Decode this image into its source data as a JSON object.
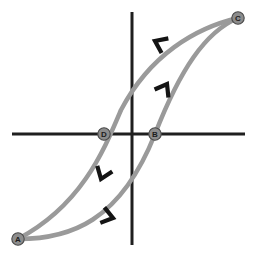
{
  "figure": {
    "title": "",
    "background_color": "#ffffff",
    "axis_color": "#1f1f1f",
    "curve_color": "#9a9a9a",
    "arrow_color": "#141414",
    "marker_fill": "#8c8c8c",
    "marker_stroke": "#4a4a4a",
    "label_color": "#1c1c1c"
  },
  "chart_data": {
    "type": "line",
    "title": "",
    "xlabel": "",
    "ylabel": "",
    "grid": false,
    "legend": null,
    "axes": {
      "origin": [
        132,
        134
      ],
      "x_axis": {
        "from": [
          12,
          134
        ],
        "to": [
          245,
          134
        ],
        "width": 3
      },
      "y_axis": {
        "from": [
          132,
          12
        ],
        "to": [
          132,
          245
        ],
        "width": 3
      }
    },
    "labeled_points": [
      {
        "label": "A",
        "x": 18,
        "y": 239,
        "role": "lower-left-saturation"
      },
      {
        "label": "B",
        "x": 155,
        "y": 134,
        "role": "positive-x-intercept"
      },
      {
        "label": "C",
        "x": 238,
        "y": 18,
        "role": "upper-right-saturation"
      },
      {
        "label": "D",
        "x": 104,
        "y": 134,
        "role": "negative-x-intercept"
      }
    ],
    "series": [
      {
        "name": "ascending-branch",
        "direction": "A to B to C",
        "path": "M 18 239 C 70 239, 120 222, 155 134 C 180 70, 205 32, 238 18",
        "points": [
          [
            18,
            239
          ],
          [
            60,
            236
          ],
          [
            100,
            222
          ],
          [
            135,
            186
          ],
          [
            155,
            134
          ],
          [
            175,
            84
          ],
          [
            205,
            44
          ],
          [
            238,
            18
          ]
        ]
      },
      {
        "name": "descending-branch",
        "direction": "C to D to A",
        "path": "M 238 18 C 195 28, 150 55, 121 110 C 104 150, 82 205, 18 239",
        "points": [
          [
            238,
            18
          ],
          [
            205,
            26
          ],
          [
            170,
            44
          ],
          [
            140,
            78
          ],
          [
            121,
            110
          ],
          [
            104,
            152
          ],
          [
            70,
            215
          ],
          [
            18,
            239
          ]
        ]
      }
    ],
    "direction_arrows": [
      {
        "name": "arrow-upper-left",
        "x": 155,
        "y": 41,
        "angle": 205,
        "on_branch": "descending-branch"
      },
      {
        "name": "arrow-right-up",
        "x": 167,
        "y": 84,
        "angle": 300,
        "on_branch": "ascending-branch"
      },
      {
        "name": "arrow-left-down",
        "x": 101,
        "y": 179,
        "angle": 110,
        "on_branch": "descending-branch"
      },
      {
        "name": "arrow-bottom-right",
        "x": 113,
        "y": 218,
        "angle": 15,
        "on_branch": "ascending-branch"
      }
    ]
  }
}
